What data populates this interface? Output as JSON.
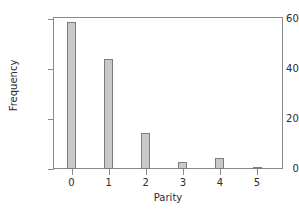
{
  "chart_data": {
    "type": "bar",
    "title": "",
    "xlabel": "Parity",
    "ylabel": "Frequency",
    "categories": [
      "0",
      "1",
      "2",
      "3",
      "4",
      "5"
    ],
    "values": [
      59,
      44,
      14.5,
      3,
      4.5,
      1
    ],
    "xlim": [
      -0.5,
      5.7
    ],
    "ylim": [
      0,
      61
    ],
    "yticks": [
      0,
      20,
      40,
      60
    ],
    "ytick_labels": [
      "0",
      "20",
      "40",
      "60"
    ],
    "xticks": [
      0,
      1,
      2,
      3,
      4,
      5
    ],
    "xtick_labels": [
      "0",
      "1",
      "2",
      "3",
      "4",
      "5"
    ],
    "grid": false,
    "legend": null,
    "bar_fill_color": "#c9c9c9",
    "bar_edge_color": "#7d7d7d",
    "axis_color": "#8a8a8a",
    "text_color": "#2b2b2b",
    "background_color": "#ffffff"
  }
}
